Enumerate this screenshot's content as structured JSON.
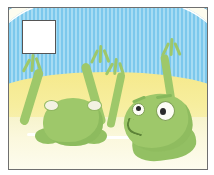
{
  "page": {
    "background_color": "#ffffff",
    "width": 214,
    "height": 175
  },
  "illustration": {
    "title": "Two cartoon frogs in water with arms raised",
    "frame_color": "#6f6f6f",
    "scene": {
      "sky": {
        "name": "blue striped wall",
        "base_color": "#8fd0ef",
        "stripe_color": "#7cc8ec",
        "arc_outline_color": "#5fa8cf"
      },
      "sand": {
        "name": "yellow sand bank",
        "color": "#f5e98c"
      },
      "water": {
        "name": "pale water pool",
        "color": "#f7f4cd",
        "ripple_color": "#ffffff",
        "ripple_count": 4
      }
    },
    "characters": [
      {
        "id": "frog-left",
        "label": "Left frog seen from behind",
        "body_color": "#9ec86a",
        "outline_color": "#86b85b",
        "pose": "both arms raised in a V",
        "eye_color": "#f3f2e2",
        "eye_count": 2
      },
      {
        "id": "frog-right",
        "label": "Right frog facing forward with worried expression",
        "body_color": "#9ec86a",
        "outline_color": "#86b85b",
        "pose": "both arms raised, head tilted left",
        "eye_color": "#fdfdf6",
        "pupil_color": "#2b2b2b",
        "expression": "frowning"
      }
    ]
  },
  "placeholder_box": {
    "label": "empty white square overlay",
    "fill_color": "#ffffff",
    "border_color": "#555555",
    "text": ""
  }
}
